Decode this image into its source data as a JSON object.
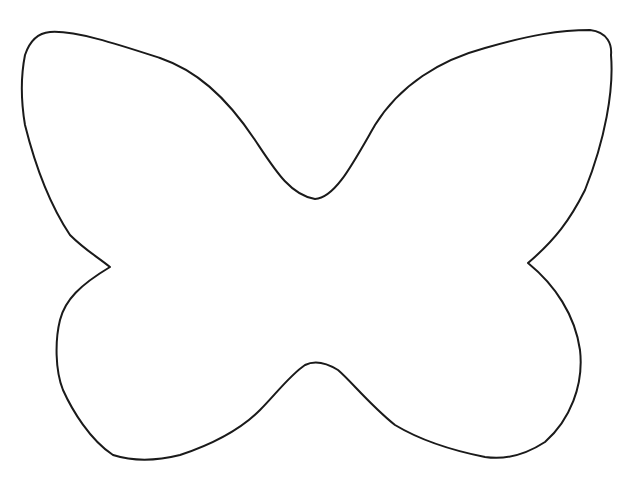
{
  "image": {
    "subject": "butterfly outline",
    "background_color": "#ffffff",
    "stroke_color": "#1a1a1a",
    "stroke_width": 2
  }
}
